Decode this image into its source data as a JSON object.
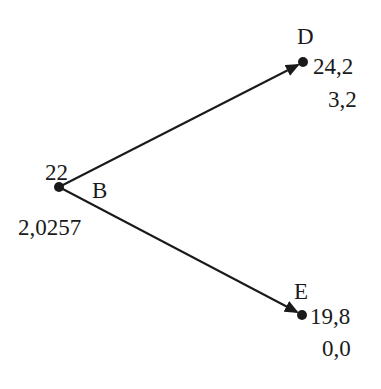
{
  "diagram": {
    "type": "binomial-tree",
    "nodes": {
      "B": {
        "name": "B",
        "price": "22",
        "value": "2,0257"
      },
      "D": {
        "name": "D",
        "price": "24,2",
        "value": "3,2"
      },
      "E": {
        "name": "E",
        "price": "19,8",
        "value": "0,0"
      }
    },
    "edges": [
      {
        "from": "B",
        "to": "D"
      },
      {
        "from": "B",
        "to": "E"
      }
    ],
    "colors": {
      "line": "#1a1a1a",
      "text": "#1a1a1a",
      "background": "#ffffff"
    }
  }
}
